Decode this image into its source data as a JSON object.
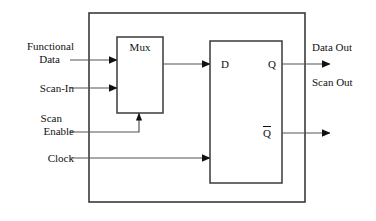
{
  "diagram": {
    "type": "block-diagram",
    "stroke_color": "#222222",
    "text_color": "#111111",
    "background": "#ffffff",
    "blocks": [
      {
        "id": "outer",
        "label": "",
        "x": 89,
        "y": 13,
        "w": 216,
        "h": 189
      },
      {
        "id": "mux",
        "label": "Mux",
        "x": 117,
        "y": 37,
        "w": 46,
        "h": 76
      },
      {
        "id": "flipflop",
        "label": "",
        "x": 210,
        "y": 41,
        "w": 72,
        "h": 142
      }
    ],
    "labels": {
      "mux": "Mux",
      "functional_data_line1": "Functional",
      "functional_data_line2": "Data",
      "scan_in": "Scan-In",
      "scan_enable_line1": "Scan",
      "scan_enable_line2": "Enable",
      "clock": "Clock",
      "d_pin": "D",
      "q_pin": "Q",
      "qbar_pin": "Q",
      "data_out": "Data Out",
      "scan_out": "Scan Out"
    },
    "inputs": [
      {
        "name": "functional-data",
        "label": "Functional Data",
        "y": 60
      },
      {
        "name": "scan-in",
        "label": "Scan-In",
        "y": 88
      },
      {
        "name": "scan-enable",
        "label": "Scan Enable",
        "y": 132
      },
      {
        "name": "clock",
        "label": "Clock",
        "y": 158
      }
    ],
    "outputs": [
      {
        "name": "data-out",
        "label": "Data Out",
        "y": 64
      },
      {
        "name": "scan-out",
        "label": "Scan Out",
        "y": 64
      },
      {
        "name": "qbar-out",
        "label": "",
        "y": 133
      }
    ],
    "pins": [
      {
        "name": "d-pin",
        "label": "D",
        "x": 227,
        "y": 64
      },
      {
        "name": "q-pin",
        "label": "Q",
        "x": 272,
        "y": 64
      },
      {
        "name": "qbar-pin",
        "label": "Q",
        "overline": true,
        "x": 266,
        "y": 133
      }
    ]
  }
}
